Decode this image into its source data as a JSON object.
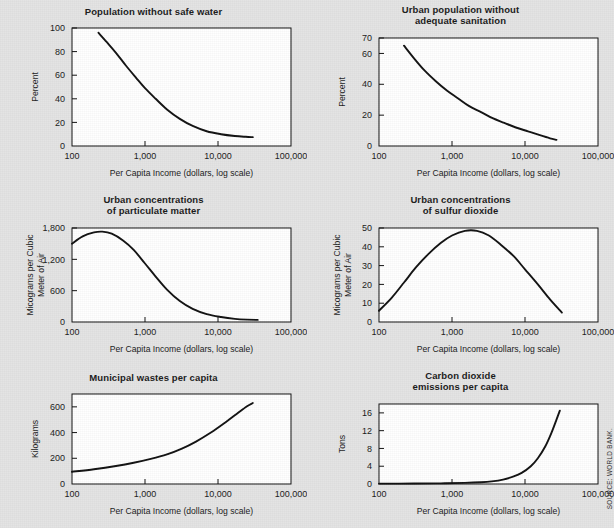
{
  "source_note": "SOURCE: WORLD BANK.",
  "common": {
    "xlabel": "Per Capita Income (dollars, log scale)",
    "xticks": [
      "100",
      "1,000",
      "10,000",
      "100,000"
    ],
    "xlim": [
      100,
      100000
    ]
  },
  "chart_data": [
    {
      "id": "safe-water",
      "type": "line",
      "title": "Population without safe water",
      "title_lines": [
        "Population without safe water"
      ],
      "xlabel": "Per Capita Income (dollars, log scale)",
      "ylabel": "Percent",
      "ylabel_lines": [
        "Percent"
      ],
      "xticks": [
        "100",
        "1,000",
        "10,000",
        "100,000"
      ],
      "yticks": [
        "0",
        "20",
        "40",
        "60",
        "80",
        "100"
      ],
      "ylim": [
        0,
        100
      ],
      "xlim": [
        100,
        100000
      ],
      "grid": false,
      "legend": "none",
      "x": [
        230,
        300,
        400,
        550,
        750,
        1000,
        1400,
        2000,
        3000,
        4500,
        7000,
        11000,
        17000,
        24000,
        30000
      ],
      "values": [
        96,
        88,
        79,
        68,
        58,
        49,
        40,
        31,
        23,
        17,
        12.5,
        10,
        8.5,
        7.8,
        7.5
      ]
    },
    {
      "id": "sanitation",
      "type": "line",
      "title": "Urban population without adequate sanitation",
      "title_lines": [
        "Urban population without",
        "adequate sanitation"
      ],
      "xlabel": "Per Capita Income (dollars, log scale)",
      "ylabel": "Percent",
      "ylabel_lines": [
        "Percent"
      ],
      "xticks": [
        "100",
        "1,000",
        "10,000",
        "100,000"
      ],
      "yticks": [
        "0",
        "20",
        "40",
        "60",
        "70"
      ],
      "ylim": [
        0,
        70
      ],
      "xlim": [
        100,
        100000
      ],
      "grid": false,
      "legend": "none",
      "x": [
        220,
        300,
        420,
        600,
        850,
        1200,
        1700,
        2500,
        3600,
        5200,
        7500,
        11000,
        16000,
        22000,
        27000
      ],
      "values": [
        65,
        57,
        49,
        42,
        36,
        31,
        26,
        22,
        18,
        15,
        12,
        9.5,
        7,
        5,
        4
      ]
    },
    {
      "id": "particulate-matter",
      "type": "line",
      "title": "Urban concentrations of particulate matter",
      "title_lines": [
        "Urban concentrations",
        "of particulate matter"
      ],
      "xlabel": "Per Capita Income (dollars, log scale)",
      "ylabel": "Micograms per Cubic Meter of Air",
      "ylabel_lines": [
        "Micograms per Cubic",
        "Meter of Air"
      ],
      "xticks": [
        "100",
        "1,000",
        "10,000",
        "100,000"
      ],
      "yticks": [
        "0",
        "600",
        "1,200",
        "1,800"
      ],
      "ylim": [
        0,
        1800
      ],
      "xlim": [
        100,
        100000
      ],
      "grid": false,
      "legend": "none",
      "x": [
        100,
        140,
        200,
        260,
        350,
        500,
        700,
        1000,
        1400,
        2000,
        3000,
        4500,
        7000,
        11000,
        17000,
        25000,
        35000
      ],
      "values": [
        1500,
        1640,
        1715,
        1730,
        1690,
        1560,
        1380,
        1120,
        870,
        620,
        400,
        250,
        150,
        95,
        60,
        45,
        40
      ]
    },
    {
      "id": "sulfur-dioxide",
      "type": "line",
      "title": "Urban concentrations of sulfur dioxide",
      "title_lines": [
        "Urban concentrations",
        "of sulfur dioxide"
      ],
      "xlabel": "Per Capita Income (dollars, log scale)",
      "ylabel": "Micograms per Cubic Meter of Air",
      "ylabel_lines": [
        "Micograms per Cubic",
        "Meter of Air"
      ],
      "xticks": [
        "100",
        "1,000",
        "10,000",
        "100,000"
      ],
      "yticks": [
        "0",
        "10",
        "20",
        "30",
        "40",
        "50"
      ],
      "ylim": [
        0,
        50
      ],
      "xlim": [
        100,
        100000
      ],
      "grid": false,
      "legend": "none",
      "x": [
        100,
        150,
        220,
        320,
        470,
        700,
        1000,
        1500,
        2200,
        3200,
        4700,
        7000,
        10000,
        15000,
        22000,
        32000
      ],
      "values": [
        6,
        13,
        21,
        29,
        36,
        42,
        46,
        48.5,
        48.5,
        46,
        41,
        35,
        28,
        20,
        12,
        5
      ]
    },
    {
      "id": "municipal-wastes",
      "type": "line",
      "title": "Municipal wastes per capita",
      "title_lines": [
        "Municipal wastes per capita"
      ],
      "xlabel": "Per Capita Income (dollars, log scale)",
      "ylabel": "Kilograms",
      "ylabel_lines": [
        "Kilograms"
      ],
      "xticks": [
        "100",
        "1,000",
        "10,000",
        "100,000"
      ],
      "yticks": [
        "0",
        "200",
        "400",
        "600"
      ],
      "ylim": [
        0,
        700
      ],
      "xlim": [
        100,
        100000
      ],
      "grid": false,
      "legend": "none",
      "x": [
        100,
        200,
        400,
        700,
        1200,
        2000,
        3200,
        5000,
        8000,
        12000,
        18000,
        25000,
        30000
      ],
      "values": [
        95,
        115,
        140,
        165,
        195,
        230,
        275,
        330,
        400,
        470,
        545,
        605,
        630
      ]
    },
    {
      "id": "carbon-dioxide",
      "type": "line",
      "title": "Carbon dioxide emissions per capita",
      "title_lines": [
        "Carbon dioxide",
        "emissions per capita"
      ],
      "xlabel": "Per Capita Income (dollars, log scale)",
      "ylabel": "Tons",
      "ylabel_lines": [
        "Tons"
      ],
      "xticks": [
        "100",
        "1,000",
        "10,000",
        "100,000"
      ],
      "yticks": [
        "0",
        "4",
        "8",
        "12",
        "16"
      ],
      "ylim": [
        0,
        18
      ],
      "xlim": [
        100,
        100000
      ],
      "grid": false,
      "legend": "none",
      "x": [
        100,
        300,
        700,
        1500,
        2500,
        3500,
        5000,
        7000,
        9000,
        12000,
        15000,
        19000,
        23000,
        27000,
        30000
      ],
      "values": [
        0.08,
        0.1,
        0.15,
        0.25,
        0.4,
        0.6,
        1.0,
        1.7,
        2.5,
        4.0,
        5.8,
        8.5,
        11.5,
        14.5,
        16.5
      ]
    }
  ]
}
